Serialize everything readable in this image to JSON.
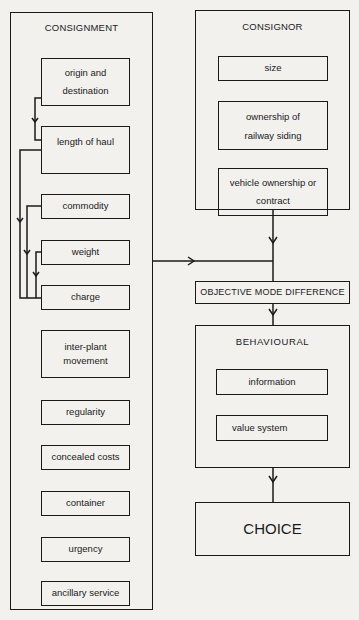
{
  "diagram": {
    "consignment": {
      "title": "CONSIGNMENT",
      "items": [
        "origin and destination",
        "length of haul",
        "commodity",
        "weight",
        "charge",
        "inter-plant movement",
        "regularity",
        "concealed costs",
        "container",
        "urgency",
        "ancillary service"
      ]
    },
    "consignor": {
      "title": "CONSIGNOR",
      "items": [
        "size",
        "ownership of railway siding",
        "vehicle ownership or contract"
      ]
    },
    "objective": {
      "label": "OBJECTIVE MODE DIFFERENCE"
    },
    "behavioural": {
      "title": "BEHAVIOURAL",
      "items": [
        "information",
        "value system"
      ]
    },
    "choice": {
      "label": "CHOICE"
    }
  }
}
